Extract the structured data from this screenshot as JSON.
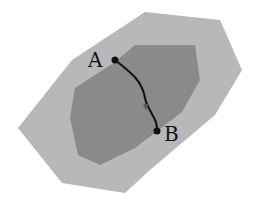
{
  "diagram": {
    "outer_region": {
      "color": "#b8b8b8",
      "points": "145,12 220,20 242,70 215,115 150,170 125,193 62,183 18,128 72,60"
    },
    "inner_region": {
      "color": "#8a8a8a",
      "points": "135,45 195,45 200,80 182,112 135,148 100,165 78,155 70,118 75,88 115,62"
    },
    "path": {
      "d": "M115,60 C130,72 142,80 145,98 C148,112 158,118 157,131",
      "color": "#111111"
    },
    "points": [
      {
        "label": "A",
        "x": 115,
        "y": 60,
        "label_x": 88,
        "label_y": 67
      },
      {
        "label": "B",
        "x": 157,
        "y": 131,
        "label_x": 164,
        "label_y": 141
      }
    ]
  }
}
